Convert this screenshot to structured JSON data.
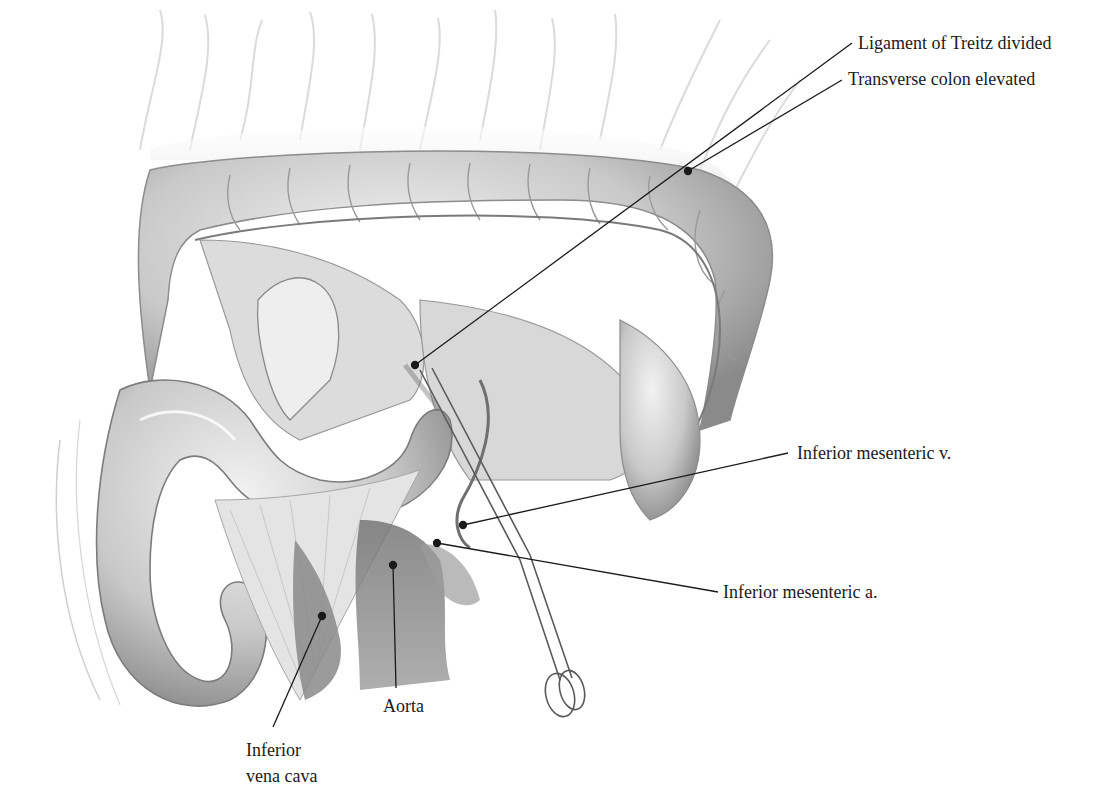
{
  "figure": {
    "style": "grayscale pencil illustration"
  },
  "labels": [
    {
      "id": "transverse-colon",
      "text": "Transverse colon elevated",
      "x": 848,
      "y": 70,
      "dot": [
        688,
        171
      ],
      "line_end": [
        842,
        80
      ]
    },
    {
      "id": "ligament-treitz",
      "text": "Ligament of Treitz divided",
      "x": 858,
      "y": 33,
      "dot": [
        415,
        365
      ],
      "line_end": [
        852,
        43
      ]
    },
    {
      "id": "inferior-mesenteric-v",
      "text": "Inferior mesenteric v.",
      "x": 797,
      "y": 443,
      "dot": [
        463,
        525
      ],
      "line_end": [
        788,
        453
      ]
    },
    {
      "id": "inferior-mesenteric-a",
      "text": "Inferior mesenteric a.",
      "x": 723,
      "y": 582,
      "dot": [
        437,
        543
      ],
      "line_end": [
        718,
        592
      ]
    },
    {
      "id": "aorta",
      "text": "Aorta",
      "x": 383,
      "y": 696,
      "dot": [
        393,
        565
      ],
      "line_end": [
        396,
        688
      ]
    },
    {
      "id": "inferior-vena-cava",
      "text_lines": [
        "Inferior",
        "vena cava"
      ],
      "x": 246,
      "y": 737,
      "dot": [
        322,
        616
      ],
      "line_end": [
        273,
        727
      ]
    }
  ],
  "text": {
    "transverse_colon": "Transverse colon elevated",
    "ligament_treitz": "Ligament of Treitz divided",
    "imv": "Inferior mesenteric v.",
    "ima": "Inferior mesenteric a.",
    "aorta": "Aorta",
    "ivc_line1": "Inferior",
    "ivc_line2": "vena cava"
  },
  "colors": {
    "background": "#ffffff",
    "text": "#1a1a1a",
    "leader_line": "#1a1a1a",
    "tissue_light": "#e6e6e6",
    "tissue_mid": "#bdbdbd",
    "tissue_dark": "#7a7a7a"
  }
}
